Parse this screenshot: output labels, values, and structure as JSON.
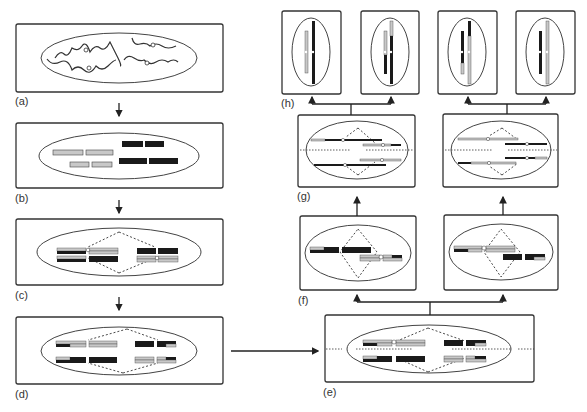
{
  "figure": {
    "colors": {
      "outline": "#333333",
      "maternal": "#1a1a1a",
      "paternal": "#c8c8c8",
      "background": "#ffffff"
    }
  },
  "panels": [
    {
      "id": "a",
      "label": "(a)",
      "name": "interphase-chromatin"
    },
    {
      "id": "b",
      "label": "(b)",
      "name": "condensed-chromosomes"
    },
    {
      "id": "c",
      "label": "(c)",
      "name": "pairing-with-spindle"
    },
    {
      "id": "d",
      "label": "(d)",
      "name": "crossover-bivalents"
    },
    {
      "id": "e",
      "label": "(e)",
      "name": "metaphase-plate"
    },
    {
      "id": "f",
      "label": "(f)",
      "name": "first-division-cells"
    },
    {
      "id": "g",
      "label": "(g)",
      "name": "second-division-metaphase"
    },
    {
      "id": "h",
      "label": "(h)",
      "name": "gamete-cells"
    }
  ]
}
